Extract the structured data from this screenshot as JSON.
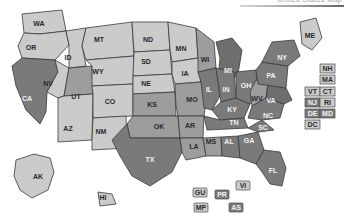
{
  "header": {
    "cut_text": "United States Map",
    "rule_visible": true
  },
  "map": {
    "title": "United States choropleth map with state abbreviations",
    "palette": {
      "light": "#cbcbcb",
      "mid": "#9d9d9d",
      "dark": "#7a7a7a",
      "darker": "#6e6e6e",
      "outline": "#3a3a3a",
      "background": "#ffffff",
      "label_light": "#2b2b2b",
      "label_dark": "#f2f2f2"
    },
    "shade_legend": [
      {
        "key": "light",
        "label": "light",
        "color": "#cbcbcb"
      },
      {
        "key": "mid",
        "label": "mid",
        "color": "#9d9d9d"
      },
      {
        "key": "dark",
        "label": "dark",
        "color": "#7a7a7a"
      }
    ],
    "states": [
      {
        "id": "WA",
        "label": "WA",
        "shade": "light",
        "lx": 39,
        "ly": 24
      },
      {
        "id": "OR",
        "label": "OR",
        "shade": "light",
        "lx": 31,
        "ly": 48
      },
      {
        "id": "CA",
        "label": "CA",
        "shade": "dark",
        "lx": 27,
        "ly": 99
      },
      {
        "id": "ID",
        "label": "ID",
        "shade": "light",
        "lx": 68,
        "ly": 58
      },
      {
        "id": "NV",
        "label": "NV",
        "shade": "light",
        "lx": 48,
        "ly": 84
      },
      {
        "id": "UT",
        "label": "UT",
        "shade": "mid",
        "lx": 76,
        "ly": 97
      },
      {
        "id": "AZ",
        "label": "AZ",
        "shade": "light",
        "lx": 68,
        "ly": 129
      },
      {
        "id": "MT",
        "label": "MT",
        "shade": "light",
        "lx": 99,
        "ly": 40
      },
      {
        "id": "WY",
        "label": "WY",
        "shade": "light",
        "lx": 98,
        "ly": 72
      },
      {
        "id": "CO",
        "label": "CO",
        "shade": "light",
        "lx": 110,
        "ly": 102
      },
      {
        "id": "NM",
        "label": "NM",
        "shade": "light",
        "lx": 101,
        "ly": 132
      },
      {
        "id": "ND",
        "label": "ND",
        "shade": "light",
        "lx": 148,
        "ly": 40
      },
      {
        "id": "SD",
        "label": "SD",
        "shade": "light",
        "lx": 146,
        "ly": 62
      },
      {
        "id": "NE",
        "label": "NE",
        "shade": "light",
        "lx": 146,
        "ly": 84
      },
      {
        "id": "KS",
        "label": "KS",
        "shade": "mid",
        "lx": 152,
        "ly": 105
      },
      {
        "id": "OK",
        "label": "OK",
        "shade": "mid",
        "lx": 159,
        "ly": 127
      },
      {
        "id": "TX",
        "label": "TX",
        "shade": "dark",
        "lx": 150,
        "ly": 160
      },
      {
        "id": "MN",
        "label": "MN",
        "shade": "light",
        "lx": 181,
        "ly": 49
      },
      {
        "id": "IA",
        "label": "IA",
        "shade": "light",
        "lx": 185,
        "ly": 74
      },
      {
        "id": "MO",
        "label": "MO",
        "shade": "mid",
        "lx": 192,
        "ly": 100
      },
      {
        "id": "AR",
        "label": "AR",
        "shade": "mid",
        "lx": 190,
        "ly": 126
      },
      {
        "id": "LA",
        "label": "LA",
        "shade": "mid",
        "lx": 194,
        "ly": 147
      },
      {
        "id": "WI",
        "label": "WI",
        "shade": "mid",
        "lx": 205,
        "ly": 60
      },
      {
        "id": "IL",
        "label": "IL",
        "shade": "dark",
        "lx": 209,
        "ly": 90
      },
      {
        "id": "MS",
        "label": "MS",
        "shade": "mid",
        "lx": 211,
        "ly": 142
      },
      {
        "id": "MI",
        "label": "MI",
        "shade": "darker",
        "lx": 228,
        "ly": 71
      },
      {
        "id": "IN",
        "label": "IN",
        "shade": "dark",
        "lx": 226,
        "ly": 90
      },
      {
        "id": "KY",
        "label": "KY",
        "shade": "dark",
        "lx": 232,
        "ly": 110
      },
      {
        "id": "TN",
        "label": "TN",
        "shade": "dark",
        "lx": 234,
        "ly": 123
      },
      {
        "id": "AL",
        "label": "AL",
        "shade": "dark",
        "lx": 229,
        "ly": 142
      },
      {
        "id": "OH",
        "label": "OH",
        "shade": "dark",
        "lx": 246,
        "ly": 86
      },
      {
        "id": "WV",
        "label": "WV",
        "shade": "mid",
        "lx": 257,
        "ly": 99
      },
      {
        "id": "GA",
        "label": "GA",
        "shade": "dark",
        "lx": 249,
        "ly": 141
      },
      {
        "id": "FL",
        "label": "FL",
        "shade": "dark",
        "lx": 273,
        "ly": 171
      },
      {
        "id": "SC",
        "label": "SC",
        "shade": "dark",
        "lx": 263,
        "ly": 128
      },
      {
        "id": "NC",
        "label": "NC",
        "shade": "dark",
        "lx": 268,
        "ly": 116
      },
      {
        "id": "VA",
        "label": "VA",
        "shade": "darker",
        "lx": 271,
        "ly": 101
      },
      {
        "id": "PA",
        "label": "PA",
        "shade": "dark",
        "lx": 271,
        "ly": 76
      },
      {
        "id": "NY",
        "label": "NY",
        "shade": "dark",
        "lx": 282,
        "ly": 58
      },
      {
        "id": "ME",
        "label": "ME",
        "shade": "light",
        "lx": 310,
        "ly": 36
      },
      {
        "id": "AK",
        "label": "AK",
        "shade": "light",
        "lx": 38,
        "ly": 177
      },
      {
        "id": "HI",
        "label": "HI",
        "shade": "light",
        "lx": 103,
        "ly": 198
      }
    ],
    "inset_chips": [
      {
        "id": "NH",
        "label": "NH",
        "shade": "light",
        "x": 320,
        "y": 64
      },
      {
        "id": "MA",
        "label": "MA",
        "shade": "light",
        "x": 320,
        "y": 75
      },
      {
        "id": "VT",
        "label": "VT",
        "shade": "light",
        "x": 305,
        "y": 87
      },
      {
        "id": "CT",
        "label": "CT",
        "shade": "light",
        "x": 320,
        "y": 87
      },
      {
        "id": "NJ",
        "label": "NJ",
        "shade": "dark",
        "x": 305,
        "y": 98
      },
      {
        "id": "RI",
        "label": "RI",
        "shade": "light",
        "x": 320,
        "y": 98
      },
      {
        "id": "DE",
        "label": "DE",
        "shade": "dark",
        "x": 305,
        "y": 109
      },
      {
        "id": "MD",
        "label": "MD",
        "shade": "dark",
        "x": 320,
        "y": 109
      },
      {
        "id": "DC",
        "label": "DC",
        "shade": "light",
        "x": 305,
        "y": 120
      }
    ],
    "territories": [
      {
        "id": "GU",
        "label": "GU",
        "shade": "light",
        "x": 193,
        "y": 188
      },
      {
        "id": "PR",
        "label": "PR",
        "shade": "dark",
        "x": 215,
        "y": 190
      },
      {
        "id": "VI",
        "label": "VI",
        "shade": "light",
        "x": 236,
        "y": 181
      },
      {
        "id": "MP",
        "label": "MP",
        "shade": "light",
        "x": 194,
        "y": 203
      },
      {
        "id": "AS",
        "label": "AS",
        "shade": "dark",
        "x": 229,
        "y": 203
      }
    ]
  }
}
